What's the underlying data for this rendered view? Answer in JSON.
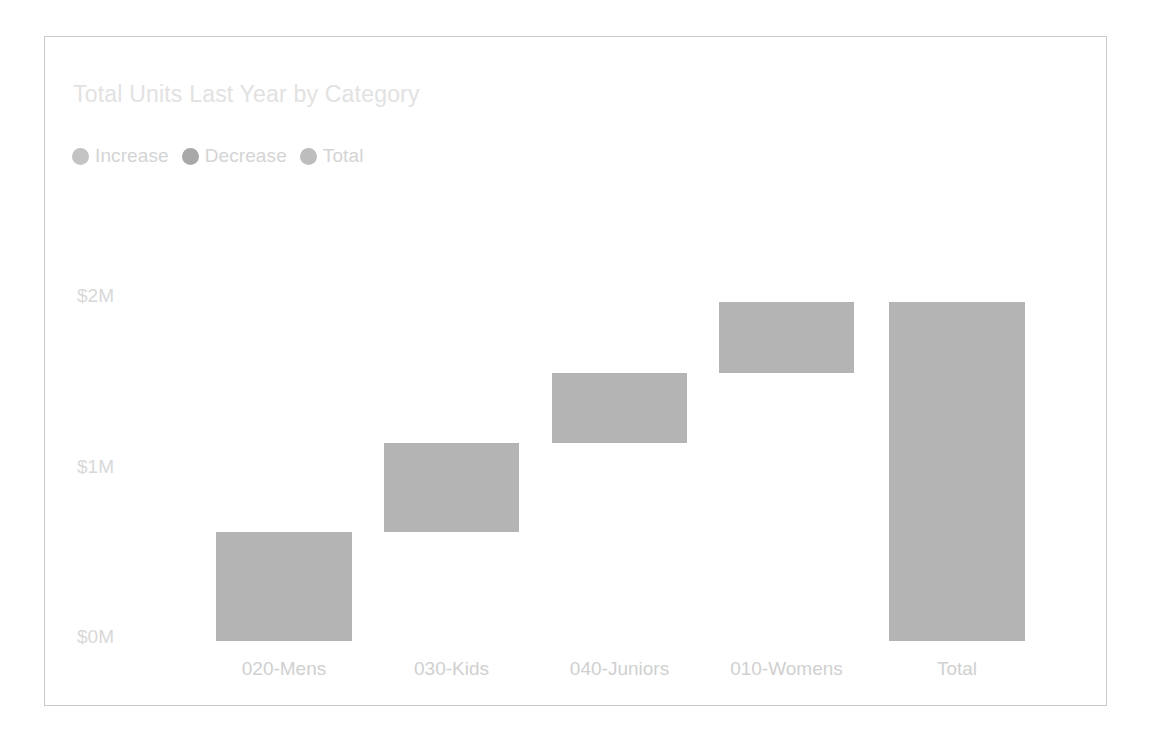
{
  "card": {
    "border_color": "#c9c9c9",
    "background": "#ffffff"
  },
  "header": {
    "title": "Total Units Last Year by Category",
    "title_color": "#e2e2e2"
  },
  "legend": {
    "position": "top-left",
    "items": [
      {
        "label": "Increase",
        "color": "#c3c3c3",
        "icon": "circle-marker-icon"
      },
      {
        "label": "Decrease",
        "color": "#a8a8a8",
        "icon": "circle-marker-icon"
      },
      {
        "label": "Total",
        "color": "#bdbdbd",
        "icon": "circle-marker-icon"
      }
    ]
  },
  "chart_data": {
    "type": "bar",
    "subtype": "waterfall",
    "title": "Total Units Last Year by Category",
    "xlabel": "",
    "ylabel": "",
    "grid": false,
    "legend_position": "top-left",
    "bar_color": "#b4b4b4",
    "categories": [
      "020-Mens",
      "030-Kids",
      "040-Juniors",
      "010-Womens",
      "Total"
    ],
    "kinds": [
      "increase",
      "increase",
      "increase",
      "increase",
      "total"
    ],
    "values": [
      0.64,
      0.52,
      0.41,
      0.42,
      1.99
    ],
    "cumulative_start": [
      0.0,
      0.64,
      1.16,
      1.57,
      0.0
    ],
    "cumulative_end": [
      0.64,
      1.16,
      1.57,
      1.99,
      1.99
    ],
    "ylim": [
      0,
      2.0
    ],
    "yticks": [
      0,
      1,
      2
    ],
    "ytick_labels": [
      "$0M",
      "$1M",
      "$2M"
    ],
    "xtick_labels": [
      "020-Mens",
      "030-Kids",
      "040-Juniors",
      "010-Womens",
      "Total"
    ],
    "bars": [
      {
        "category": "020-Mens",
        "kind": "increase",
        "start": 0.0,
        "end": 0.64,
        "value": 0.64
      },
      {
        "category": "030-Kids",
        "kind": "increase",
        "start": 0.64,
        "end": 1.16,
        "value": 0.52
      },
      {
        "category": "040-Juniors",
        "kind": "increase",
        "start": 1.16,
        "end": 1.57,
        "value": 0.41
      },
      {
        "category": "010-Womens",
        "kind": "increase",
        "start": 1.57,
        "end": 1.99,
        "value": 0.42
      },
      {
        "category": "Total",
        "kind": "total",
        "start": 0.0,
        "end": 1.99,
        "value": 1.99
      }
    ]
  },
  "axis": {
    "y_labels": [
      "$2M",
      "$1M",
      "$0M"
    ],
    "x_labels": [
      "020-Mens",
      "030-Kids",
      "040-Juniors",
      "010-Womens",
      "Total"
    ],
    "label_color": "#d4d4d4"
  }
}
